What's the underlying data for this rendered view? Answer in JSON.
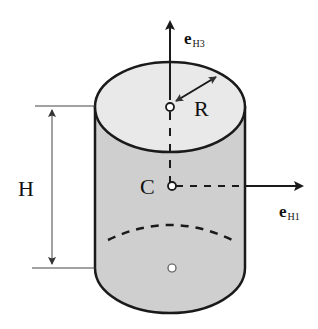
{
  "diagram": {
    "type": "cylinder-coordinate-frame",
    "labels": {
      "e_h3": {
        "base": "e",
        "sub": "H3"
      },
      "e_h1": {
        "base": "e",
        "sub": "H1"
      },
      "radius": "R",
      "height": "H",
      "center": "C"
    },
    "colors": {
      "side_fill": "#cfcfcf",
      "top_fill": "#e9e9e9",
      "stroke": "#1a1a1a"
    }
  }
}
